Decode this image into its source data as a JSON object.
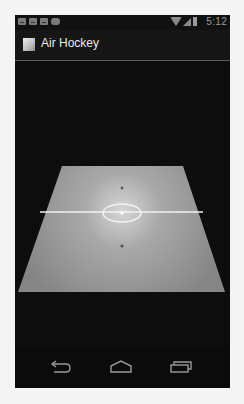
{
  "status_bar": {
    "notification_icons": [
      "gmail-icon",
      "gmail-icon",
      "gmail-icon",
      "cloud-icon"
    ],
    "system_icons": [
      "wifi-icon",
      "signal-icon",
      "battery-icon"
    ],
    "time": "5:12"
  },
  "action_bar": {
    "app_icon": "app-icon",
    "title": "Air Hockey"
  },
  "scene": {
    "description": "3D perspective air hockey table",
    "table_color": "#8f8f8f",
    "table_center_glow": "#d8d8d8",
    "line_color": "#f0f0f0",
    "mallet_color": "#555555",
    "background_color": "#0d0d0d"
  },
  "nav_bar": {
    "buttons": [
      {
        "name": "back",
        "icon": "back-icon"
      },
      {
        "name": "home",
        "icon": "home-icon"
      },
      {
        "name": "recents",
        "icon": "recents-icon"
      }
    ]
  }
}
